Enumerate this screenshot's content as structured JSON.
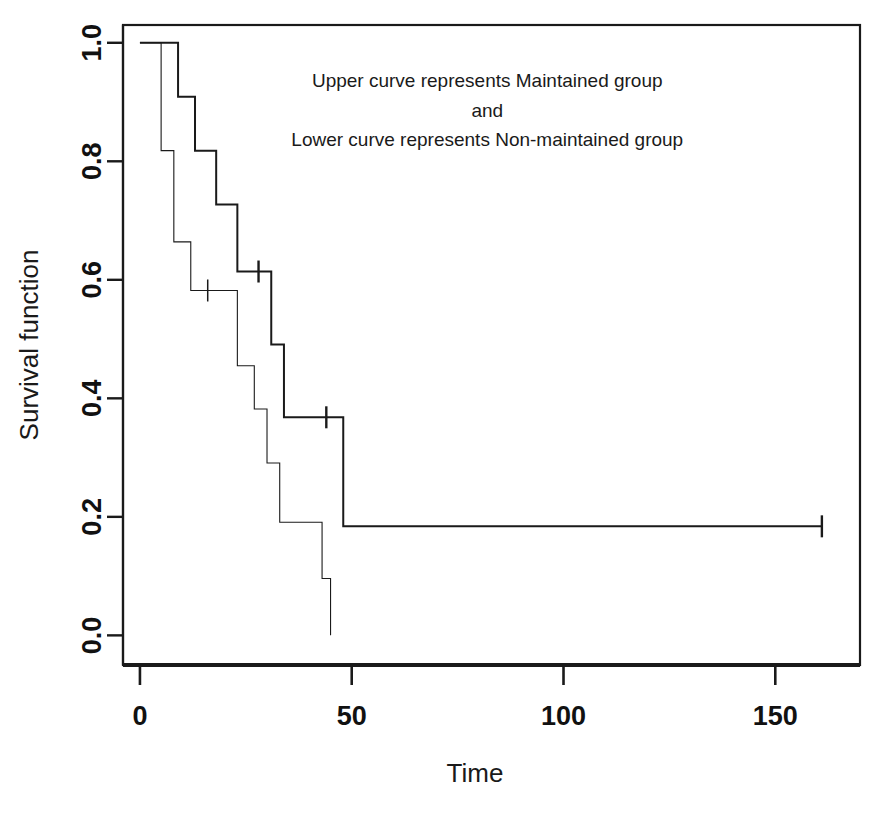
{
  "chart_data": {
    "type": "line",
    "subtype": "kaplan-meier-step",
    "title": "",
    "xlabel": "Time",
    "ylabel": "Survival function",
    "xlim": [
      -4,
      170
    ],
    "ylim": [
      -0.05,
      1.03
    ],
    "xticks": [
      0,
      50,
      100,
      150
    ],
    "xtick_labels": [
      "0",
      "50",
      "100",
      "150"
    ],
    "yticks": [
      0.0,
      0.2,
      0.4,
      0.6,
      0.8,
      1.0
    ],
    "ytick_labels": [
      "0.0",
      "0.2",
      "0.4",
      "0.6",
      "0.8",
      "1.0"
    ],
    "grid": false,
    "legend_position": "none",
    "frame": true,
    "annotations": [
      {
        "text": "Upper curve represents Maintained group",
        "x": 82,
        "y": 0.925
      },
      {
        "text": "and",
        "x": 82,
        "y": 0.875
      },
      {
        "text": "Lower curve represents Non-maintained group",
        "x": 82,
        "y": 0.825
      }
    ],
    "series": [
      {
        "name": "Maintained group",
        "style": "upper-curve",
        "linewidth": 2.0,
        "color": "#1a1a1a",
        "steps": [
          {
            "time": 0,
            "survival": 1.0
          },
          {
            "time": 9,
            "survival": 1.0
          },
          {
            "time": 9,
            "survival": 0.909
          },
          {
            "time": 13,
            "survival": 0.909
          },
          {
            "time": 13,
            "survival": 0.818
          },
          {
            "time": 18,
            "survival": 0.818
          },
          {
            "time": 18,
            "survival": 0.727
          },
          {
            "time": 23,
            "survival": 0.727
          },
          {
            "time": 23,
            "survival": 0.614
          },
          {
            "time": 31,
            "survival": 0.614
          },
          {
            "time": 31,
            "survival": 0.491
          },
          {
            "time": 34,
            "survival": 0.491
          },
          {
            "time": 34,
            "survival": 0.368
          },
          {
            "time": 48,
            "survival": 0.368
          },
          {
            "time": 48,
            "survival": 0.184
          },
          {
            "time": 161,
            "survival": 0.184
          }
        ],
        "censored": [
          {
            "time": 28,
            "survival": 0.614
          },
          {
            "time": 44,
            "survival": 0.368
          },
          {
            "time": 161,
            "survival": 0.184
          }
        ]
      },
      {
        "name": "Non-maintained group",
        "style": "lower-curve",
        "linewidth": 1.1,
        "color": "#1a1a1a",
        "steps": [
          {
            "time": 0,
            "survival": 1.0
          },
          {
            "time": 5,
            "survival": 1.0
          },
          {
            "time": 5,
            "survival": 0.818
          },
          {
            "time": 8,
            "survival": 0.818
          },
          {
            "time": 8,
            "survival": 0.664
          },
          {
            "time": 12,
            "survival": 0.664
          },
          {
            "time": 12,
            "survival": 0.582
          },
          {
            "time": 23,
            "survival": 0.582
          },
          {
            "time": 23,
            "survival": 0.455
          },
          {
            "time": 27,
            "survival": 0.455
          },
          {
            "time": 27,
            "survival": 0.382
          },
          {
            "time": 30,
            "survival": 0.382
          },
          {
            "time": 30,
            "survival": 0.291
          },
          {
            "time": 33,
            "survival": 0.291
          },
          {
            "time": 33,
            "survival": 0.191
          },
          {
            "time": 43,
            "survival": 0.191
          },
          {
            "time": 43,
            "survival": 0.096
          },
          {
            "time": 45,
            "survival": 0.096
          },
          {
            "time": 45,
            "survival": 0.0
          }
        ],
        "censored": [
          {
            "time": 16,
            "survival": 0.582
          }
        ]
      }
    ]
  },
  "axes": {
    "x_title": "Time",
    "y_title": "Survival function"
  },
  "annotation_lines": {
    "line1": "Upper curve represents Maintained group",
    "line2": "and",
    "line3": "Lower curve represents Non-maintained group"
  },
  "colors": {
    "ink": "#1a1a1a",
    "background": "#ffffff"
  }
}
